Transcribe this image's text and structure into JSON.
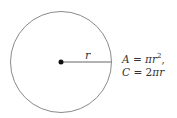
{
  "diagram": {
    "shape": "circle",
    "radius_label": "r",
    "formulas": {
      "area": {
        "lhs": "A",
        "eq": " = ",
        "rhs_pi": "π",
        "rhs_var": "r",
        "exp": "2",
        "suffix": ","
      },
      "circumference": {
        "lhs": "C",
        "eq": " = ",
        "rhs_coef": "2",
        "rhs_pi": "π",
        "rhs_var": "r"
      }
    },
    "colors": {
      "stroke": "#888888",
      "dot": "#111111",
      "text": "#333333"
    }
  }
}
